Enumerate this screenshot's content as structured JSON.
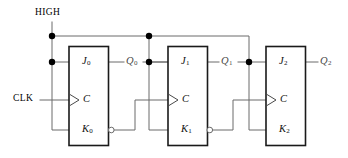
{
  "diagram": {
    "supply_label": "HIGH",
    "clock_label": "CLK",
    "colors": {
      "wire": "#6b6b6b",
      "box": "#1a1a1a",
      "node": "#000000",
      "text": "#000000",
      "output_text": "#4a4a4a"
    },
    "stages": [
      {
        "name": "flip-flop-0",
        "j_label": "J",
        "j_sub": "0",
        "k_label": "K",
        "k_sub": "0",
        "clock_label": "C",
        "q_label": "Q",
        "q_sub": "0"
      },
      {
        "name": "flip-flop-1",
        "j_label": "J",
        "j_sub": "1",
        "k_label": "K",
        "k_sub": "1",
        "clock_label": "C",
        "q_label": "Q",
        "q_sub": "1"
      },
      {
        "name": "flip-flop-2",
        "j_label": "J",
        "j_sub": "2",
        "k_label": "K",
        "k_sub": "2",
        "clock_label": "C",
        "q_label": "Q",
        "q_sub": "2"
      }
    ]
  }
}
